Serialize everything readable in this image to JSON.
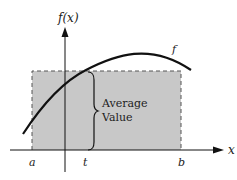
{
  "diagram": {
    "y_axis_label": "f(x)",
    "x_axis_label": "x",
    "curve_label": "f",
    "brace_label_line1": "Average",
    "brace_label_line2": "Value",
    "tick_labels": {
      "a": "a",
      "t": "t",
      "b": "b"
    },
    "colors": {
      "shade": "#c8c8c8",
      "stroke": "#111111"
    }
  }
}
